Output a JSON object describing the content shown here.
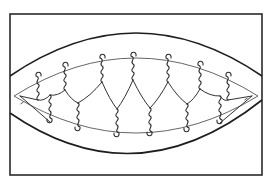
{
  "figure": {
    "colors": {
      "line": "#2a2a2a",
      "background": "#ffffff"
    },
    "frame": {
      "x": 10,
      "y": 14,
      "width": 252,
      "height": 161
    },
    "outer_lens": {
      "top_arc": {
        "x1": 10,
        "y1": 76,
        "cx": 136,
        "cy": -10,
        "x2": 262,
        "y2": 76
      },
      "bottom_arc": {
        "x1": 10,
        "y1": 113,
        "cx": 136,
        "cy": 200,
        "x2": 262,
        "y2": 100
      }
    },
    "inner_lens": {
      "top_arc": {
        "x1": 14,
        "y1": 96,
        "cx": 136,
        "cy": 20,
        "x2": 258,
        "y2": 96
      },
      "bottom_arc": {
        "x1": 14,
        "y1": 96,
        "cx": 136,
        "cy": 170,
        "x2": 258,
        "y2": 96
      }
    },
    "upper_twists": [
      {
        "x": 38,
        "top": 73
      },
      {
        "x": 65,
        "top": 63
      },
      {
        "x": 102,
        "top": 55
      },
      {
        "x": 133,
        "top": 53
      },
      {
        "x": 168,
        "top": 55
      },
      {
        "x": 200,
        "top": 62
      },
      {
        "x": 228,
        "top": 73
      }
    ],
    "lower_twists": [
      {
        "x": 50,
        "bottom": 122
      },
      {
        "x": 78,
        "bottom": 130
      },
      {
        "x": 117,
        "bottom": 136
      },
      {
        "x": 150,
        "bottom": 135
      },
      {
        "x": 187,
        "bottom": 131
      },
      {
        "x": 220,
        "bottom": 123
      }
    ],
    "twist_length": 24,
    "end_ticks": [
      {
        "x": 22,
        "y": 103
      },
      {
        "x": 246,
        "y": 99
      }
    ]
  }
}
